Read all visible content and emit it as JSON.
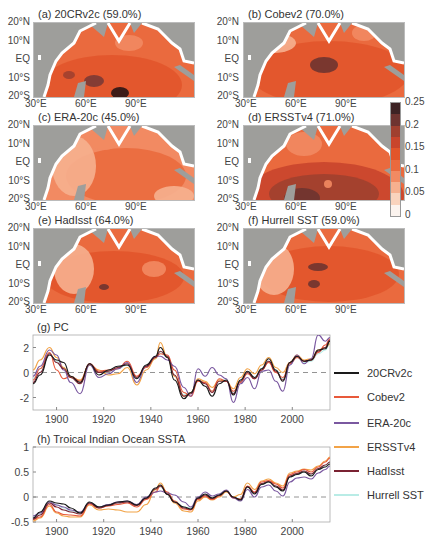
{
  "maps": {
    "lat_ticks": [
      "20°N",
      "10°N",
      "EQ",
      "10°S",
      "20°S"
    ],
    "lon_ticks": [
      "30°E",
      "60°E",
      "90°E"
    ],
    "panels": [
      {
        "id": "a",
        "title": "(a) 20CRv2c (59.0%)"
      },
      {
        "id": "b",
        "title": "(b) Cobev2 (70.0%)"
      },
      {
        "id": "c",
        "title": "(c) ERA-20c (45.0%)"
      },
      {
        "id": "d",
        "title": "(d) ERSSTv4 (71.0%)"
      },
      {
        "id": "e",
        "title": "(e) HadIsst (64.0%)"
      },
      {
        "id": "f",
        "title": "(f) Hurrell SST (59.0%)"
      }
    ],
    "colorbar": {
      "ticks": [
        "0.25",
        "0.2",
        "0.15",
        "0.1",
        "0.05",
        "0"
      ],
      "colors": [
        "#fbf3ee",
        "#f9d3bd",
        "#f6b08f",
        "#f28a62",
        "#ea6a3e",
        "#e2552b",
        "#c9452c",
        "#a0402f",
        "#6e3430",
        "#3d2324"
      ]
    },
    "land_color": "#9e9e9b"
  },
  "chart_data": [
    {
      "type": "line",
      "title": "(g) PC",
      "xlabel": "",
      "ylabel": "",
      "xlim": [
        1890,
        2016
      ],
      "ylim": [
        -3,
        3
      ],
      "xticks": [
        "1900",
        "1920",
        "1940",
        "1960",
        "1980",
        "2000"
      ],
      "yticks": [
        "2",
        "0",
        "-2"
      ],
      "zero_line": "dashed",
      "x": [
        1890,
        1893,
        1897,
        1900,
        1903,
        1906,
        1910,
        1914,
        1918,
        1922,
        1926,
        1930,
        1934,
        1938,
        1942,
        1944,
        1947,
        1950,
        1954,
        1957,
        1960,
        1963,
        1966,
        1969,
        1972,
        1975,
        1978,
        1981,
        1984,
        1987,
        1990,
        1993,
        1996,
        1999,
        2002,
        2005,
        2008,
        2011,
        2014,
        2016
      ],
      "series": [
        {
          "name": "20CRv2c",
          "color": "#1a1a1a",
          "values": [
            -0.9,
            -0.2,
            1.4,
            1.0,
            0.8,
            -0.3,
            -0.8,
            0.7,
            -0.2,
            0.2,
            0.5,
            0.6,
            -0.5,
            0.6,
            1.3,
            2.0,
            1.2,
            -0.6,
            -2.1,
            -1.6,
            -0.6,
            -1.1,
            -1.9,
            -0.9,
            -0.6,
            -1.8,
            -0.6,
            0.1,
            -0.4,
            0.3,
            1.1,
            0.2,
            -0.7,
            0.8,
            1.3,
            0.9,
            1.0,
            1.8,
            1.9,
            2.5
          ]
        },
        {
          "name": "Cobev2",
          "color": "#e8593a",
          "values": [
            -0.6,
            0.3,
            1.6,
            0.2,
            -0.5,
            -0.3,
            -0.7,
            0.7,
            0.1,
            0.2,
            0.3,
            0.9,
            -0.3,
            0.4,
            1.2,
            1.5,
            1.4,
            0.2,
            -1.6,
            -1.9,
            -0.7,
            -0.8,
            -1.5,
            -0.5,
            -0.7,
            -1.5,
            -0.8,
            -0.1,
            -0.5,
            0.2,
            0.8,
            0.0,
            -0.4,
            0.7,
            1.2,
            0.9,
            1.0,
            1.6,
            2.2,
            2.7
          ]
        },
        {
          "name": "ERA-20c",
          "color": "#7a58a0",
          "values": [
            -0.3,
            0.5,
            1.8,
            1.4,
            0.2,
            -0.8,
            -1.7,
            0.6,
            -0.4,
            -0.1,
            0.3,
            0.8,
            -0.8,
            0.5,
            1.3,
            1.3,
            1.0,
            0.5,
            -1.2,
            -1.9,
            0.3,
            -0.3,
            0.4,
            -0.2,
            -0.5,
            -2.4,
            -0.9,
            -0.4,
            -1.3,
            0.1,
            0.2,
            -0.7,
            -1.5,
            0.6,
            1.4,
            0.7,
            1.1,
            3.0,
            2.5,
            2.8
          ]
        },
        {
          "name": "ERSSTv4",
          "color": "#f2a347",
          "values": [
            0.2,
            1.0,
            2.0,
            1.2,
            0.4,
            -0.4,
            -0.6,
            0.6,
            0.2,
            -0.2,
            -0.1,
            0.4,
            -1.0,
            0.2,
            1.1,
            2.4,
            1.2,
            -0.3,
            -1.9,
            -1.6,
            -0.5,
            -0.7,
            -1.2,
            -0.6,
            -0.7,
            -1.3,
            -0.4,
            0.3,
            -0.1,
            0.6,
            1.2,
            0.4,
            0.0,
            0.8,
            1.4,
            1.0,
            1.1,
            1.8,
            2.0,
            2.3
          ]
        },
        {
          "name": "HadIsst",
          "color": "#7a2232",
          "values": [
            -0.8,
            0.0,
            1.5,
            0.8,
            0.3,
            -0.4,
            -0.9,
            0.7,
            0.0,
            0.1,
            0.4,
            0.7,
            -0.4,
            0.5,
            1.2,
            1.7,
            1.3,
            -0.2,
            -1.9,
            -1.7,
            -0.6,
            -0.9,
            -1.6,
            -0.7,
            -0.7,
            -1.7,
            -0.7,
            0.0,
            -0.5,
            0.2,
            0.9,
            0.1,
            -0.6,
            0.8,
            1.3,
            0.9,
            1.0,
            1.7,
            2.0,
            2.6
          ]
        },
        {
          "name": "Hurrell SST",
          "color": "#b9ece6",
          "values": [
            -0.5,
            0.3,
            1.5,
            0.9,
            0.4,
            -0.3,
            -0.7,
            0.6,
            0.0,
            0.1,
            0.3,
            0.6,
            -0.5,
            0.4,
            1.1,
            1.6,
            1.2,
            -0.2,
            -1.8,
            -1.6,
            -0.6,
            -0.8,
            -1.5,
            -0.6,
            -0.6,
            -1.6,
            -0.6,
            0.0,
            -0.4,
            0.3,
            0.9,
            0.2,
            -0.5,
            0.7,
            1.2,
            0.8,
            0.9,
            1.5,
            1.8,
            2.3
          ]
        }
      ]
    },
    {
      "type": "line",
      "title": "(h) Troical Indian Ocean SSTA",
      "xlabel": "",
      "ylabel": "",
      "xlim": [
        1890,
        2016
      ],
      "ylim": [
        -0.5,
        1
      ],
      "xticks": [
        "1900",
        "1920",
        "1940",
        "1960",
        "1980",
        "2000"
      ],
      "yticks": [
        "1",
        "0.5",
        "0",
        "-0.5"
      ],
      "zero_line": "dashed",
      "x": [
        1890,
        1893,
        1897,
        1900,
        1903,
        1906,
        1910,
        1914,
        1918,
        1922,
        1926,
        1930,
        1934,
        1938,
        1942,
        1944,
        1947,
        1950,
        1954,
        1957,
        1960,
        1963,
        1966,
        1969,
        1972,
        1975,
        1978,
        1981,
        1984,
        1987,
        1990,
        1993,
        1996,
        1999,
        2002,
        2005,
        2008,
        2011,
        2014,
        2016
      ],
      "series": [
        {
          "name": "20CRv2c",
          "color": "#1a1a1a",
          "values": [
            -0.42,
            -0.3,
            -0.08,
            -0.12,
            -0.14,
            -0.22,
            -0.32,
            -0.1,
            -0.2,
            -0.16,
            -0.1,
            -0.08,
            -0.16,
            -0.02,
            0.18,
            0.24,
            0.05,
            -0.1,
            -0.2,
            -0.24,
            -0.02,
            0.06,
            -0.02,
            0.04,
            0.12,
            0.0,
            -0.06,
            0.2,
            0.06,
            0.25,
            0.3,
            0.2,
            0.12,
            0.4,
            0.45,
            0.5,
            0.42,
            0.55,
            0.6,
            0.66
          ]
        },
        {
          "name": "Cobev2",
          "color": "#e8593a",
          "values": [
            -0.45,
            -0.4,
            -0.15,
            -0.3,
            -0.35,
            -0.36,
            -0.38,
            -0.14,
            -0.22,
            -0.18,
            -0.15,
            -0.12,
            -0.2,
            -0.05,
            0.1,
            0.22,
            0.1,
            -0.08,
            -0.24,
            -0.26,
            -0.05,
            0.02,
            -0.05,
            0.02,
            0.12,
            -0.02,
            -0.04,
            0.22,
            0.1,
            0.3,
            0.33,
            0.26,
            0.18,
            0.45,
            0.5,
            0.55,
            0.5,
            0.6,
            0.7,
            0.78
          ]
        },
        {
          "name": "ERA-20c",
          "color": "#7a58a0",
          "values": [
            -0.38,
            -0.32,
            -0.1,
            -0.16,
            -0.2,
            -0.26,
            -0.3,
            -0.12,
            -0.2,
            -0.15,
            -0.1,
            -0.08,
            -0.15,
            0.0,
            0.1,
            0.12,
            0.08,
            0.04,
            -0.1,
            -0.2,
            0.0,
            0.1,
            0.02,
            0.06,
            0.14,
            -0.02,
            -0.08,
            0.15,
            0.0,
            0.2,
            0.24,
            0.12,
            0.02,
            0.3,
            0.38,
            0.4,
            0.36,
            0.48,
            0.55,
            0.62
          ]
        },
        {
          "name": "ERSSTv4",
          "color": "#f2a347",
          "values": [
            -0.48,
            -0.42,
            -0.18,
            -0.32,
            -0.38,
            -0.4,
            -0.4,
            -0.16,
            -0.26,
            -0.24,
            -0.26,
            -0.3,
            -0.3,
            -0.15,
            0.15,
            0.28,
            0.08,
            -0.12,
            -0.28,
            -0.3,
            -0.08,
            0.0,
            -0.06,
            0.0,
            0.1,
            0.0,
            0.05,
            0.28,
            0.15,
            0.32,
            0.36,
            0.28,
            0.22,
            0.48,
            0.52,
            0.56,
            0.54,
            0.62,
            0.72,
            0.8
          ]
        },
        {
          "name": "HadIsst",
          "color": "#7a2232",
          "values": [
            -0.44,
            -0.36,
            -0.12,
            -0.2,
            -0.26,
            -0.3,
            -0.34,
            -0.12,
            -0.22,
            -0.17,
            -0.12,
            -0.1,
            -0.17,
            -0.03,
            0.16,
            0.22,
            0.06,
            -0.1,
            -0.22,
            -0.25,
            -0.03,
            0.04,
            -0.03,
            0.03,
            0.12,
            -0.01,
            -0.05,
            0.21,
            0.08,
            0.27,
            0.31,
            0.22,
            0.14,
            0.42,
            0.47,
            0.52,
            0.46,
            0.57,
            0.64,
            0.7
          ]
        },
        {
          "name": "Hurrell SST",
          "color": "#b9ece6",
          "values": [
            -0.4,
            -0.34,
            -0.1,
            -0.16,
            -0.22,
            -0.28,
            -0.32,
            -0.11,
            -0.2,
            -0.16,
            -0.11,
            -0.09,
            -0.16,
            -0.02,
            0.14,
            0.2,
            0.06,
            -0.08,
            -0.2,
            -0.22,
            -0.02,
            0.05,
            -0.02,
            0.04,
            0.12,
            0.0,
            -0.04,
            0.2,
            0.08,
            0.26,
            0.3,
            0.22,
            0.14,
            0.4,
            0.45,
            0.5,
            0.45,
            0.55,
            0.62,
            0.68
          ]
        }
      ]
    }
  ],
  "legend": [
    "20CRv2c",
    "Cobev2",
    "ERA-20c",
    "ERSSTv4",
    "HadIsst",
    "Hurrell SST"
  ]
}
